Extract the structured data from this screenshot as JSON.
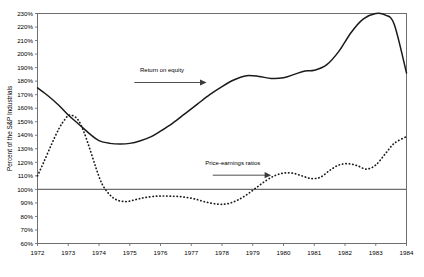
{
  "chart_data": {
    "type": "line",
    "title": "",
    "xlabel": "",
    "ylabel": "Percent of the S&P Industrials",
    "xlim": [
      1972,
      1984
    ],
    "ylim": [
      60,
      230
    ],
    "grid": false,
    "legend_position": "inline-annotations",
    "x_ticks": [
      "1972",
      "1973",
      "1974",
      "1975",
      "1976",
      "1977",
      "1978",
      "1979",
      "1980",
      "1981",
      "1982",
      "1983",
      "1984"
    ],
    "y_ticks": [
      "230%",
      "220%",
      "210%",
      "200%",
      "190%",
      "180%",
      "170%",
      "160%",
      "150%",
      "140%",
      "130%",
      "120%",
      "110%",
      "100%",
      "90%",
      "80%",
      "70%",
      "60%"
    ],
    "reference_line": {
      "value": 100,
      "label": "100%"
    },
    "annotations": [
      {
        "name": "return-on-equity",
        "text": "Return on equity",
        "text_x": 1976.05,
        "text_y": 187,
        "arrow_from_x": 1975.15,
        "arrow_from_y": 179,
        "arrow_to_x": 1977.5,
        "arrow_to_y": 179
      },
      {
        "name": "price-earnings-ratios",
        "text": "Price-earnings ratios",
        "text_x": 1978.35,
        "text_y": 118,
        "arrow_from_x": 1977.7,
        "arrow_from_y": 110.5,
        "arrow_to_x": 1979.6,
        "arrow_to_y": 110.5
      }
    ],
    "series": [
      {
        "name": "Return on equity",
        "style": "solid",
        "color": "#1a1a1a",
        "x": [
          1972.0,
          1972.35,
          1972.7,
          1973.0,
          1973.35,
          1973.7,
          1974.0,
          1974.35,
          1974.7,
          1975.0,
          1975.35,
          1975.7,
          1976.0,
          1976.4,
          1976.8,
          1977.2,
          1977.6,
          1978.0,
          1978.4,
          1978.8,
          1979.2,
          1979.6,
          1980.0,
          1980.35,
          1980.7,
          1981.0,
          1981.4,
          1981.8,
          1982.2,
          1982.6,
          1983.0,
          1983.3,
          1983.6,
          1984.0
        ],
        "values": [
          175,
          169,
          162,
          155,
          148,
          141,
          136,
          134,
          133.5,
          134,
          136,
          139,
          143,
          149,
          156,
          163,
          170,
          176,
          181,
          184,
          183.5,
          182,
          182.5,
          185,
          187.5,
          188,
          192,
          202,
          216,
          226,
          230,
          229,
          222,
          186
        ]
      },
      {
        "name": "Price-earnings ratios",
        "style": "dotted",
        "color": "#1a1a1a",
        "x": [
          1972.0,
          1972.2,
          1972.45,
          1972.7,
          1972.9,
          1973.05,
          1973.3,
          1973.5,
          1973.7,
          1973.9,
          1974.1,
          1974.35,
          1974.6,
          1974.9,
          1975.2,
          1975.5,
          1975.9,
          1976.3,
          1976.7,
          1977.1,
          1977.5,
          1977.9,
          1978.2,
          1978.5,
          1978.8,
          1979.1,
          1979.4,
          1979.7,
          1980.0,
          1980.3,
          1980.6,
          1980.9,
          1981.2,
          1981.5,
          1981.8,
          1982.1,
          1982.4,
          1982.7,
          1983.0,
          1983.3,
          1983.6,
          1984.0
        ],
        "values": [
          110,
          120,
          133,
          145,
          152,
          155,
          152,
          143,
          130,
          116,
          104,
          96,
          92,
          91,
          92.5,
          94,
          95,
          95,
          94.5,
          93,
          90.5,
          89,
          89.5,
          92,
          96,
          101,
          106,
          110,
          112,
          112,
          110,
          108,
          109,
          114,
          118,
          119,
          117.5,
          115,
          118,
          126,
          134,
          139
        ]
      }
    ]
  },
  "colors": {
    "axis": "#6e6e6e",
    "line": "#1a1a1a",
    "reference_line": "#6e6e6e",
    "annotation_arrow": "#3a3a3a",
    "background": "#ffffff"
  }
}
